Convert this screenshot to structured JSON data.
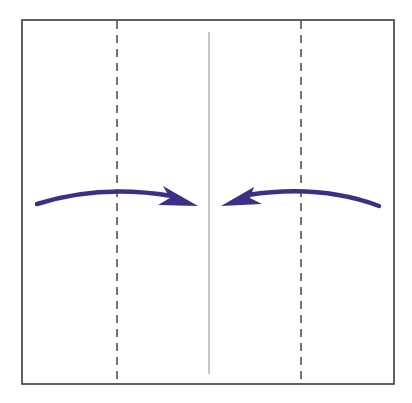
{
  "diagram": {
    "title": "Fold left and right edges to center crease",
    "type": "origami-fold-instruction",
    "colors": {
      "background": "#ffffff",
      "paper_edge": "#3a3a3a",
      "valley_fold": "#3a3a3a",
      "center_crease": "#8a8a8a",
      "arrow": "#3d2f86"
    },
    "paper": {
      "x": 22,
      "y": 20,
      "width": 372,
      "height": 364
    },
    "lines": [
      {
        "name": "valley-fold-left",
        "style": "dashed",
        "x": 117
      },
      {
        "name": "center-crease",
        "style": "solid-thin",
        "x": 209,
        "y1": 32,
        "y2": 374
      },
      {
        "name": "valley-fold-right",
        "style": "dashed",
        "x": 301
      }
    ],
    "arrows": [
      {
        "name": "fold-arrow-left-to-center",
        "direction": "right"
      },
      {
        "name": "fold-arrow-right-to-center",
        "direction": "left"
      }
    ]
  }
}
